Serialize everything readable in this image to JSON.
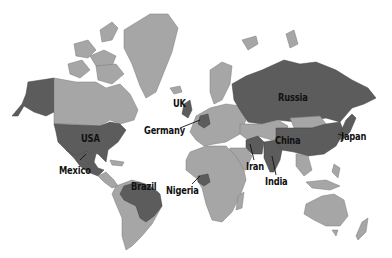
{
  "map": {
    "type": "world-choropleth",
    "colors": {
      "highlighted": "#5c5c5c",
      "other_land": "#a6a6a6",
      "background": "#ffffff",
      "label": "#111111"
    },
    "highlighted_countries": [
      "USA",
      "Mexico",
      "Brazil",
      "UK",
      "Germany",
      "Nigeria",
      "Russia",
      "Iran",
      "India",
      "China",
      "Japan"
    ],
    "labels": {
      "usa": "USA",
      "mexico": "Mexico",
      "brazil": "Brazil",
      "uk": "UK",
      "germany": "Germany",
      "nigeria": "Nigeria",
      "russia": "Russia",
      "iran": "Iran",
      "india": "India",
      "china": "China",
      "japan": "Japan"
    }
  }
}
